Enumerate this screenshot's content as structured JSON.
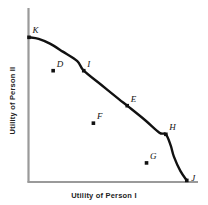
{
  "chart_data": {
    "type": "scatter",
    "title": "",
    "xlabel": "Utility of Person I",
    "ylabel": "Utility of Person II",
    "grid": false,
    "legend": null,
    "xlim": [
      0,
      100
    ],
    "ylim": [
      0,
      100
    ],
    "axis_ticks": {
      "x": [],
      "y": []
    },
    "curve": {
      "name": "utility possibility frontier",
      "color": "#111111",
      "on_curve_points": [
        "K",
        "I",
        "E",
        "H",
        "J"
      ],
      "path_points": [
        {
          "x": 0,
          "y": 91
        },
        {
          "x": 6,
          "y": 90
        },
        {
          "x": 13,
          "y": 87
        },
        {
          "x": 21,
          "y": 82
        },
        {
          "x": 30,
          "y": 76
        },
        {
          "x": 34,
          "y": 70
        },
        {
          "x": 45,
          "y": 61
        },
        {
          "x": 56,
          "y": 52
        },
        {
          "x": 61,
          "y": 48
        },
        {
          "x": 72,
          "y": 39
        },
        {
          "x": 81,
          "y": 31
        },
        {
          "x": 85,
          "y": 30
        },
        {
          "x": 88,
          "y": 23
        },
        {
          "x": 90,
          "y": 16
        },
        {
          "x": 94,
          "y": 7
        },
        {
          "x": 98,
          "y": 1
        }
      ]
    },
    "points": [
      {
        "id": "K",
        "label": "K",
        "x": 0,
        "y": 91,
        "on_curve": true,
        "label_pos": "above-right"
      },
      {
        "id": "D",
        "label": "D",
        "x": 15,
        "y": 70,
        "on_curve": false,
        "label_pos": "above-right"
      },
      {
        "id": "I",
        "label": "I",
        "x": 34,
        "y": 70,
        "on_curve": true,
        "label_pos": "above-right"
      },
      {
        "id": "E",
        "label": "E",
        "x": 61,
        "y": 48,
        "on_curve": true,
        "label_pos": "above-right"
      },
      {
        "id": "F",
        "label": "F",
        "x": 40,
        "y": 37,
        "on_curve": false,
        "label_pos": "above-right"
      },
      {
        "id": "H",
        "label": "H",
        "x": 85,
        "y": 30,
        "on_curve": true,
        "label_pos": "above-right"
      },
      {
        "id": "G",
        "label": "G",
        "x": 73,
        "y": 12,
        "on_curve": false,
        "label_pos": "above-right"
      },
      {
        "id": "J",
        "label": "J",
        "x": 98,
        "y": 1,
        "on_curve": true,
        "label_pos": "right"
      }
    ]
  },
  "colors": {
    "axis": "#9a9a9a",
    "curve": "#111111",
    "point": "#111111",
    "label_text": "#111111",
    "axis_title": "#222222",
    "background": "#ffffff"
  }
}
